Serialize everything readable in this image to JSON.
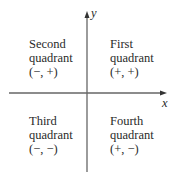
{
  "diagram": {
    "type": "coordinate-plane-quadrants",
    "axes": {
      "x_label": "x",
      "y_label": "y"
    },
    "quadrants": [
      {
        "id": "second",
        "line1": "Second",
        "line2": "quadrant",
        "signs": "(−, +)"
      },
      {
        "id": "first",
        "line1": "First",
        "line2": "quadrant",
        "signs": "(+, +)"
      },
      {
        "id": "third",
        "line1": "Third",
        "line2": "quadrant",
        "signs": "(−, −)"
      },
      {
        "id": "fourth",
        "line1": "Fourth",
        "line2": "quadrant",
        "signs": "(+, −)"
      }
    ],
    "colors": {
      "axis": "#555555",
      "text": "#2a2a2a"
    }
  }
}
